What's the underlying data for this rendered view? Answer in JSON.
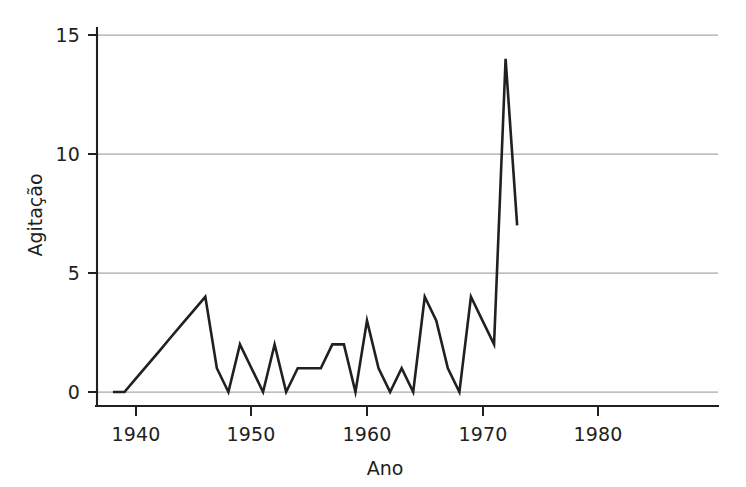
{
  "chart_data": {
    "type": "line",
    "title": "",
    "xlabel": "Ano",
    "ylabel": "Agitação",
    "xlim": [
      1937,
      1981
    ],
    "ylim": [
      0,
      15.6
    ],
    "xticks": [
      1940,
      1950,
      1960,
      1970,
      1980
    ],
    "xticklabels": [
      "1940",
      "1950",
      "1960",
      "1970",
      "1980"
    ],
    "yticks": [
      0,
      5,
      10,
      15
    ],
    "yticklabels": [
      "0",
      "5",
      "10",
      "15"
    ],
    "grid": "horizontal",
    "legend": "none",
    "line_color": "#231f20",
    "grid_color": "#a8a8a8",
    "axis_color": "#231f20",
    "background": "#ffffff",
    "x": [
      1938,
      1939,
      1940,
      1941,
      1942,
      1943,
      1944,
      1945,
      1946,
      1947,
      1948,
      1949,
      1950,
      1951,
      1952,
      1953,
      1954,
      1955,
      1956,
      1957,
      1958,
      1959,
      1960,
      1961,
      1962,
      1963,
      1964,
      1965,
      1966,
      1967,
      1968,
      1969,
      1970,
      1971,
      1972,
      1973
    ],
    "values": [
      0,
      0,
      0.57,
      1.14,
      1.71,
      2.29,
      2.86,
      3.43,
      4,
      1,
      0,
      2,
      1,
      0,
      2,
      0,
      1,
      1,
      1,
      2,
      2,
      0,
      3,
      1,
      0,
      1,
      0,
      4,
      3,
      1,
      0,
      4,
      3,
      2,
      14,
      7
    ],
    "series": [
      {
        "name": "Agitação",
        "values": [
          0,
          0,
          0.57,
          1.14,
          1.71,
          2.29,
          2.86,
          3.43,
          4,
          1,
          0,
          2,
          1,
          0,
          2,
          0,
          1,
          1,
          1,
          2,
          2,
          0,
          3,
          1,
          0,
          1,
          0,
          4,
          3,
          1,
          0,
          4,
          3,
          2,
          14,
          7
        ]
      }
    ]
  },
  "axes": {
    "x_title": "Ano",
    "y_title": "Agitação"
  }
}
